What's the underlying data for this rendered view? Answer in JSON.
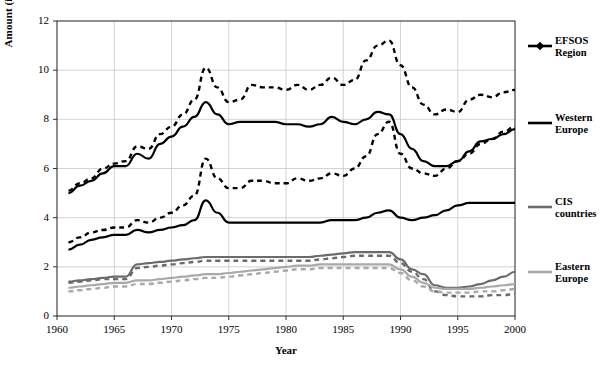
{
  "chart_data": {
    "type": "line",
    "title": "",
    "xlabel": "Year",
    "ylabel": "Amount (in million cubic metres)",
    "xlim": [
      1960,
      2000
    ],
    "ylim": [
      0,
      12
    ],
    "xticks": [
      1960,
      1965,
      1970,
      1975,
      1980,
      1985,
      1990,
      1995,
      2000
    ],
    "yticks": [
      0,
      2,
      4,
      6,
      8,
      10,
      12
    ],
    "grid": true,
    "legend_position": "right",
    "x": [
      1961,
      1962,
      1963,
      1964,
      1965,
      1966,
      1967,
      1968,
      1969,
      1970,
      1971,
      1972,
      1973,
      1974,
      1975,
      1976,
      1977,
      1978,
      1979,
      1980,
      1981,
      1982,
      1983,
      1984,
      1985,
      1986,
      1987,
      1988,
      1989,
      1990,
      1991,
      1992,
      1993,
      1994,
      1995,
      1996,
      1997,
      1998,
      1999,
      2000
    ],
    "series": [
      {
        "name": "EFSOS Region",
        "style": "dashed",
        "color": "#000000",
        "values": [
          5.1,
          5.4,
          5.6,
          6.0,
          6.2,
          6.3,
          6.9,
          6.8,
          7.4,
          7.7,
          8.2,
          8.8,
          10.1,
          9.3,
          8.7,
          8.8,
          9.4,
          9.3,
          9.3,
          9.2,
          9.4,
          9.2,
          9.4,
          9.7,
          9.4,
          9.6,
          10.4,
          11.0,
          11.2,
          10.2,
          9.3,
          8.6,
          8.2,
          8.4,
          8.3,
          8.8,
          9.0,
          8.9,
          9.1,
          9.2
        ]
      },
      {
        "name": "EFSOS Region (solid)",
        "style": "solid",
        "color": "#000000",
        "values": [
          5.0,
          5.3,
          5.5,
          5.8,
          6.1,
          6.1,
          6.6,
          6.4,
          7.0,
          7.3,
          7.7,
          8.1,
          8.7,
          8.2,
          7.8,
          7.9,
          7.9,
          7.9,
          7.9,
          7.8,
          7.8,
          7.7,
          7.8,
          8.1,
          7.9,
          7.8,
          8.0,
          8.3,
          8.2,
          7.4,
          6.8,
          6.3,
          6.1,
          6.1,
          6.3,
          6.7,
          7.1,
          7.2,
          7.4,
          7.6
        ]
      },
      {
        "name": "Western Europe",
        "style": "dashed",
        "color": "#000000",
        "values": [
          3.0,
          3.2,
          3.4,
          3.5,
          3.6,
          3.6,
          3.9,
          3.8,
          4.0,
          4.2,
          4.5,
          4.9,
          6.4,
          5.6,
          5.2,
          5.2,
          5.5,
          5.5,
          5.4,
          5.4,
          5.6,
          5.5,
          5.6,
          5.8,
          5.7,
          6.0,
          6.5,
          7.4,
          7.9,
          6.6,
          6.0,
          5.8,
          5.7,
          6.0,
          6.3,
          6.6,
          7.0,
          7.2,
          7.5,
          7.7
        ]
      },
      {
        "name": "Western Europe (solid)",
        "style": "solid",
        "color": "#000000",
        "values": [
          2.7,
          2.9,
          3.1,
          3.2,
          3.3,
          3.3,
          3.5,
          3.4,
          3.5,
          3.6,
          3.7,
          3.9,
          4.7,
          4.2,
          3.8,
          3.8,
          3.8,
          3.8,
          3.8,
          3.8,
          3.8,
          3.8,
          3.8,
          3.9,
          3.9,
          3.9,
          4.0,
          4.2,
          4.3,
          4.0,
          3.9,
          4.0,
          4.1,
          4.3,
          4.5,
          4.6,
          4.6,
          4.6,
          4.6,
          4.6
        ]
      },
      {
        "name": "CIS countries",
        "style": "solid",
        "color": "#6b6b6b",
        "values": [
          1.4,
          1.45,
          1.5,
          1.55,
          1.6,
          1.6,
          2.1,
          2.15,
          2.2,
          2.25,
          2.3,
          2.35,
          2.4,
          2.4,
          2.4,
          2.4,
          2.4,
          2.4,
          2.4,
          2.4,
          2.4,
          2.4,
          2.45,
          2.5,
          2.55,
          2.6,
          2.6,
          2.6,
          2.6,
          2.3,
          1.9,
          1.7,
          1.25,
          1.15,
          1.15,
          1.2,
          1.3,
          1.45,
          1.6,
          1.8
        ]
      },
      {
        "name": "CIS countries (dashed)",
        "style": "dashed",
        "color": "#6b6b6b",
        "values": [
          1.35,
          1.4,
          1.45,
          1.5,
          1.5,
          1.5,
          1.95,
          2.0,
          2.05,
          2.1,
          2.15,
          2.2,
          2.25,
          2.25,
          2.25,
          2.25,
          2.25,
          2.25,
          2.25,
          2.25,
          2.25,
          2.25,
          2.3,
          2.35,
          2.4,
          2.45,
          2.45,
          2.45,
          2.45,
          2.15,
          1.8,
          1.5,
          1.0,
          0.85,
          0.8,
          0.8,
          0.8,
          0.85,
          0.85,
          0.9
        ]
      },
      {
        "name": "Eastern Europe",
        "style": "solid",
        "color": "#a9a9a9",
        "values": [
          1.15,
          1.2,
          1.25,
          1.3,
          1.35,
          1.35,
          1.45,
          1.45,
          1.5,
          1.55,
          1.6,
          1.65,
          1.7,
          1.7,
          1.75,
          1.8,
          1.85,
          1.9,
          1.95,
          2.0,
          2.05,
          2.05,
          2.1,
          2.1,
          2.1,
          2.1,
          2.1,
          2.1,
          2.1,
          1.9,
          1.6,
          1.35,
          1.15,
          1.1,
          1.1,
          1.1,
          1.15,
          1.2,
          1.25,
          1.3
        ]
      },
      {
        "name": "Eastern Europe (dashed)",
        "style": "dashed",
        "color": "#a9a9a9",
        "values": [
          1.0,
          1.05,
          1.1,
          1.15,
          1.2,
          1.2,
          1.3,
          1.3,
          1.35,
          1.4,
          1.45,
          1.5,
          1.55,
          1.55,
          1.6,
          1.65,
          1.7,
          1.75,
          1.8,
          1.85,
          1.9,
          1.9,
          1.95,
          1.95,
          1.95,
          1.95,
          1.95,
          1.95,
          1.95,
          1.75,
          1.45,
          1.2,
          1.0,
          0.95,
          0.95,
          0.95,
          1.0,
          1.0,
          1.05,
          1.1
        ]
      }
    ],
    "legend": [
      {
        "label_line1": "EFSOS",
        "label_line2": "Region",
        "color": "#000000",
        "marker": "diamond"
      },
      {
        "label_line1": "Western",
        "label_line2": "Europe",
        "color": "#000000",
        "marker": "none"
      },
      {
        "label_line1": "CIS",
        "label_line2": "countries",
        "color": "#6b6b6b",
        "marker": "none"
      },
      {
        "label_line1": "Eastern",
        "label_line2": "Europe",
        "color": "#a9a9a9",
        "marker": "none"
      }
    ]
  }
}
